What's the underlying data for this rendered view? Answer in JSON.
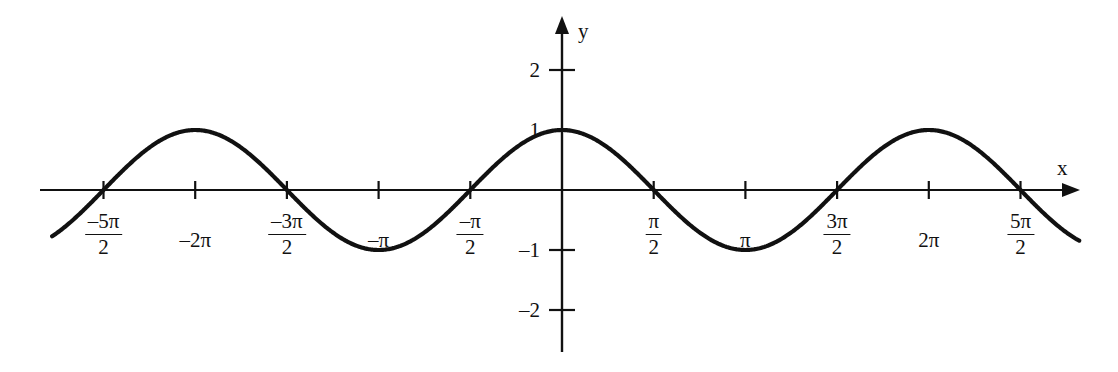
{
  "figure": {
    "background_color": "#ffffff",
    "curve_color": "#111111",
    "axis_color": "#111111",
    "x_axis_label": "x",
    "y_axis_label": "y"
  },
  "axes": {
    "x_ticks": [
      {
        "label_num": "–5π",
        "label_den": "2",
        "type": "fraction",
        "value": -2.5
      },
      {
        "label": "–2π",
        "type": "plain",
        "value": -2.0
      },
      {
        "label_num": "–3π",
        "label_den": "2",
        "type": "fraction",
        "value": -1.5
      },
      {
        "label": "–π",
        "type": "plain",
        "value": -1.0
      },
      {
        "label_num": "–π",
        "label_den": "2",
        "type": "fraction",
        "value": -0.5
      },
      {
        "label_num": "π",
        "label_den": "2",
        "type": "fraction",
        "value": 0.5
      },
      {
        "label": "π",
        "type": "plain",
        "value": 1.0
      },
      {
        "label_num": "3π",
        "label_den": "2",
        "type": "fraction",
        "value": 1.5
      },
      {
        "label": "2π",
        "type": "plain",
        "value": 2.0
      },
      {
        "label_num": "5π",
        "label_den": "2",
        "type": "fraction",
        "value": 2.5
      }
    ],
    "y_ticks": [
      {
        "label": "2",
        "value": 2
      },
      {
        "label": "1",
        "value": 1
      },
      {
        "label": "–1",
        "value": -1
      },
      {
        "label": "–2",
        "value": -2
      }
    ]
  },
  "chart_data": {
    "type": "line",
    "title": "",
    "xlabel": "x",
    "ylabel": "y",
    "function": "y = cos(x)",
    "grid": false,
    "legend": "none",
    "xlim": [
      -2.78,
      2.82
    ],
    "ylim": [
      -2.8,
      2.85
    ],
    "xlim_units": "pi",
    "ylim_units": "1",
    "x_tick_values_pi": [
      -2.5,
      -2.0,
      -1.5,
      -1.0,
      -0.5,
      0.5,
      1.0,
      1.5,
      2.0,
      2.5
    ],
    "x_tick_labels": [
      "-5π/2",
      "-2π",
      "-3π/2",
      "-π",
      "-π/2",
      "π/2",
      "π",
      "3π/2",
      "2π",
      "5π/2"
    ],
    "y_tick_values": [
      2,
      1,
      -1,
      -2
    ],
    "y_tick_labels": [
      "2",
      "1",
      "-1",
      "-2"
    ],
    "series": [
      {
        "name": "cos(x)",
        "x_pi": [
          -2.78,
          -2.5,
          -2.25,
          -2.0,
          -1.75,
          -1.5,
          -1.25,
          -1.0,
          -0.75,
          -0.5,
          -0.25,
          0.0,
          0.25,
          0.5,
          0.75,
          1.0,
          1.25,
          1.5,
          1.75,
          2.0,
          2.25,
          2.5,
          2.82
        ],
        "values": [
          -0.77,
          0.0,
          0.707,
          1.0,
          0.707,
          0.0,
          -0.707,
          -1.0,
          -0.707,
          0.0,
          0.707,
          1.0,
          0.707,
          0.0,
          -0.707,
          -1.0,
          -0.707,
          0.0,
          0.707,
          1.0,
          0.707,
          0.0,
          -0.9
        ]
      }
    ],
    "key_points": {
      "maxima_x_pi": [
        -2.0,
        0.0,
        2.0
      ],
      "maxima_y": 1,
      "minima_x_pi": [
        -1.0,
        1.0
      ],
      "minima_y": -1,
      "zeros_x_pi": [
        -2.5,
        -1.5,
        -0.5,
        0.5,
        1.5,
        2.5
      ]
    }
  }
}
